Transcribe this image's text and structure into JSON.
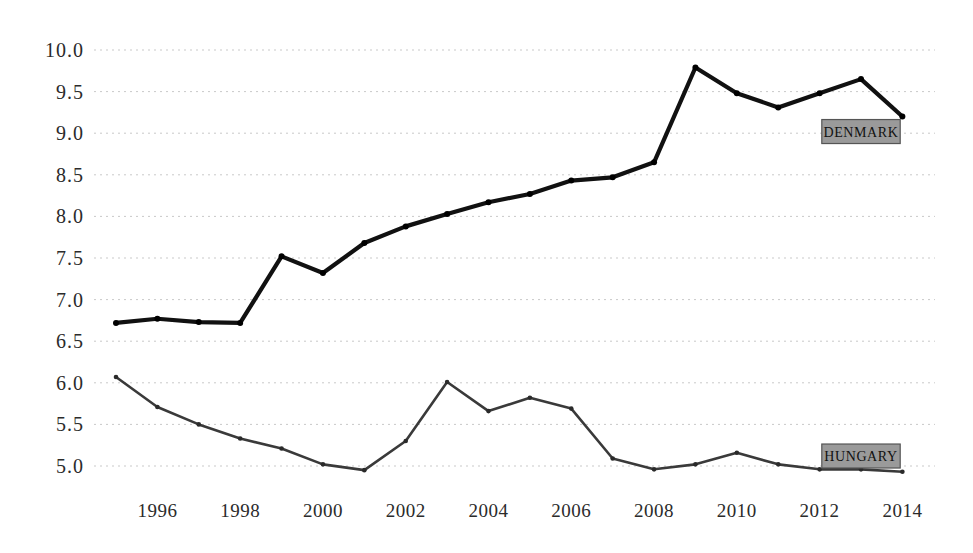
{
  "chart_data": {
    "type": "line",
    "title": "",
    "subtitle": "",
    "xlabel": "",
    "ylabel": "",
    "x": [
      1995,
      1996,
      1997,
      1998,
      1999,
      2000,
      2001,
      2002,
      2003,
      2004,
      2005,
      2006,
      2007,
      2008,
      2009,
      2010,
      2011,
      2012,
      2013,
      2014
    ],
    "xtick_labels": [
      "1996",
      "1998",
      "2000",
      "2002",
      "2004",
      "2006",
      "2008",
      "2010",
      "2012",
      "2014"
    ],
    "xtick_values": [
      1996,
      1998,
      2000,
      2002,
      2004,
      2006,
      2008,
      2010,
      2012,
      2014
    ],
    "ytick_labels": [
      "10.0",
      "9.5",
      "9.0",
      "8.5",
      "8.0",
      "7.5",
      "7.0",
      "6.5",
      "6.0",
      "5.5",
      "5.0"
    ],
    "ytick_values": [
      10.0,
      9.5,
      9.0,
      8.5,
      8.0,
      7.5,
      7.0,
      6.5,
      6.0,
      5.5,
      5.0
    ],
    "ylim": [
      4.78,
      10.12
    ],
    "xlim": [
      1994.6,
      2014.7
    ],
    "grid": true,
    "legend_position": "inline-right",
    "series": [
      {
        "name": "DENMARK",
        "color": "#111111",
        "values": [
          6.72,
          6.77,
          6.73,
          6.72,
          7.52,
          7.32,
          7.68,
          7.88,
          8.03,
          8.17,
          8.27,
          8.43,
          8.47,
          8.65,
          9.79,
          9.48,
          9.31,
          9.48,
          9.65,
          9.2
        ]
      },
      {
        "name": "HUNGARY",
        "color": "#3a3a3a",
        "values": [
          6.07,
          5.71,
          5.5,
          5.33,
          5.21,
          5.02,
          4.95,
          5.3,
          6.01,
          5.66,
          5.82,
          5.69,
          5.09,
          4.96,
          5.02,
          5.16,
          5.02,
          4.96,
          4.96,
          4.93
        ]
      }
    ],
    "annotations": [
      {
        "name": "DENMARK",
        "text": "DENMARK",
        "x": 2013.0,
        "y": 9.02,
        "box_fill": "#9a9a9a",
        "box_stroke": "#555555"
      },
      {
        "name": "HUNGARY",
        "text": "HUNGARY",
        "x": 2013.0,
        "y": 5.12,
        "box_fill": "#9a9a9a",
        "box_stroke": "#555555"
      }
    ]
  }
}
